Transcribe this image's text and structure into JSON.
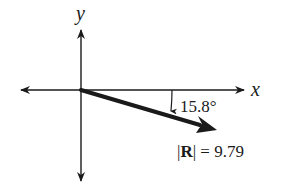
{
  "diagram": {
    "type": "vector-diagram",
    "axes": {
      "x_label": "x",
      "y_label": "y"
    },
    "vector": {
      "name": "R",
      "magnitude_label_prefix": "|",
      "magnitude_label_symbol": "R",
      "magnitude_label_suffix": "| = 9.79",
      "magnitude": 9.79,
      "angle_label": "15.8°",
      "angle_degrees": 15.8,
      "direction": "below positive x-axis"
    },
    "colors": {
      "ink": "#1a1a1a",
      "background": "#ffffff"
    }
  }
}
